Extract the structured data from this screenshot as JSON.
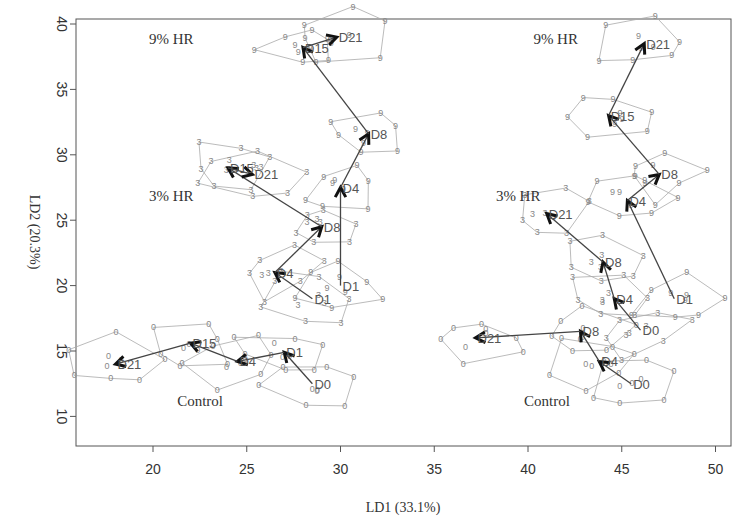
{
  "chart_data": {
    "type": "scatter",
    "title": "",
    "xlabel": "LD1 (33.1%)",
    "ylabel": "LD2 (20.3%)",
    "xlim": [
      16.5,
      51.5
    ],
    "ylim": [
      9.5,
      41.5
    ],
    "xticks": [
      20,
      25,
      30,
      35,
      40,
      45,
      50
    ],
    "yticks": [
      10,
      15,
      20,
      25,
      30,
      35,
      40
    ],
    "grid": false,
    "point_markers": {
      "Control": "0",
      "3% HR": "3",
      "9% HR": "9"
    },
    "group_labels": [
      {
        "text": "9% HR",
        "x": 20,
        "y": 38.5
      },
      {
        "text": "3% HR",
        "x": 20,
        "y": 26.5
      },
      {
        "text": "Control",
        "x": 21.5,
        "y": 10.8
      },
      {
        "text": "9% HR",
        "x": 40.5,
        "y": 38.5
      },
      {
        "text": "3% HR",
        "x": 38.5,
        "y": 26.5
      },
      {
        "text": "Control",
        "x": 40,
        "y": 10.8
      }
    ],
    "series": [
      {
        "name": "Left Control",
        "marker": "0",
        "centroids": [
          {
            "day": "D0",
            "x": 28.5,
            "y": 12.5
          },
          {
            "day": "D1",
            "x": 27.0,
            "y": 14.9
          },
          {
            "day": "D4",
            "x": 24.5,
            "y": 14.2
          },
          {
            "day": "D15",
            "x": 22.0,
            "y": 15.6
          },
          {
            "day": "D21",
            "x": 18.0,
            "y": 14.0
          }
        ]
      },
      {
        "name": "Left 3% HR",
        "marker": "3",
        "centroids": [
          {
            "day": "D1",
            "x": 28.5,
            "y": 19.0
          },
          {
            "day": "D4",
            "x": 26.5,
            "y": 21.0
          },
          {
            "day": "D8",
            "x": 29.0,
            "y": 24.5
          },
          {
            "day": "D15",
            "x": 24.0,
            "y": 29.0
          },
          {
            "day": "D21",
            "x": 25.3,
            "y": 28.5
          }
        ]
      },
      {
        "name": "Left 9% HR",
        "marker": "9",
        "centroids": [
          {
            "day": "D1",
            "x": 30.0,
            "y": 20.0
          },
          {
            "day": "D4",
            "x": 30.0,
            "y": 27.5
          },
          {
            "day": "D8",
            "x": 31.5,
            "y": 31.6
          },
          {
            "day": "D15",
            "x": 28.0,
            "y": 38.2
          },
          {
            "day": "D21",
            "x": 29.8,
            "y": 39.0
          }
        ]
      },
      {
        "name": "Right Control",
        "marker": "0",
        "centroids": [
          {
            "day": "D0",
            "x": 45.5,
            "y": 12.5
          },
          {
            "day": "D4",
            "x": 43.8,
            "y": 14.2
          },
          {
            "day": "D8",
            "x": 42.8,
            "y": 16.5
          },
          {
            "day": "D21",
            "x": 37.2,
            "y": 16.0
          }
        ]
      },
      {
        "name": "Right 3% HR",
        "marker": "3",
        "centroids": [
          {
            "day": "D0",
            "x": 46.0,
            "y": 16.6
          },
          {
            "day": "D4",
            "x": 44.6,
            "y": 19.0
          },
          {
            "day": "D8",
            "x": 44.0,
            "y": 21.8
          },
          {
            "day": "D21",
            "x": 41.0,
            "y": 25.5
          }
        ]
      },
      {
        "name": "Right 9% HR",
        "marker": "9",
        "centroids": [
          {
            "day": "D1",
            "x": 47.8,
            "y": 19.0
          },
          {
            "day": "D4",
            "x": 45.3,
            "y": 26.5
          },
          {
            "day": "D8",
            "x": 47.0,
            "y": 28.5
          },
          {
            "day": "D15",
            "x": 44.3,
            "y": 33.0
          },
          {
            "day": "D21",
            "x": 46.2,
            "y": 38.5
          }
        ]
      }
    ]
  },
  "axes": {
    "xlabel": "LD1 (33.1%)",
    "ylabel": "LD2 (20.3%)",
    "xticks": [
      "20",
      "25",
      "30",
      "35",
      "40",
      "45",
      "50"
    ],
    "yticks": [
      "10",
      "15",
      "20",
      "25",
      "30",
      "35",
      "40"
    ]
  }
}
